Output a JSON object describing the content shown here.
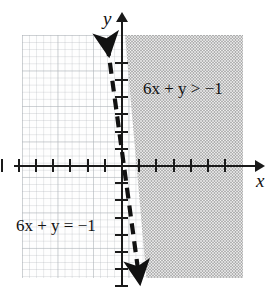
{
  "figure": {
    "kind": "cartesian-graph-linear-inequality",
    "axis_labels": {
      "x": "x",
      "y": "y"
    },
    "labels": {
      "inequality": "6x + y > −1",
      "equation": "6x + y = −1"
    },
    "colors": {
      "axis": "#1a1a1a",
      "line": "#111111",
      "shade": "#a9a9a9",
      "grid": "#bec3c8",
      "background": "#ffffff"
    }
  },
  "chart_data": {
    "type": "line",
    "title": "",
    "xlabel": "x",
    "ylabel": "y",
    "xlim": [
      -7,
      7
    ],
    "ylim": [
      -7,
      7
    ],
    "grid": true,
    "legend": "none",
    "x_ticks": [
      -7,
      -6,
      -5,
      -4,
      -3,
      -2,
      -1,
      1,
      2,
      3,
      4,
      5,
      6
    ],
    "y_ticks": [
      -7,
      -6,
      -5,
      -4,
      -3,
      -2,
      -1,
      1,
      2,
      3,
      4,
      5,
      6
    ],
    "series": [
      {
        "name": "6x + y = −1",
        "equation": "6x + y = -1",
        "slope": -6,
        "y_intercept": -1,
        "x_intercept": -0.1667,
        "style": "dashed",
        "arrows": "both",
        "points": [
          {
            "x": -0.8333,
            "y": 4
          },
          {
            "x": -0.1667,
            "y": 0
          },
          {
            "x": 0.8333,
            "y": -6
          }
        ]
      }
    ],
    "shaded_region": {
      "inequality": "6x + y > -1",
      "side": "right-of-line",
      "boundary_included": false,
      "fill": "gray-halftone",
      "test_point": {
        "x": 1,
        "y": 0,
        "satisfies": true
      }
    },
    "annotations": [
      {
        "text": "6x + y > −1",
        "x": 2.2,
        "y": 4.5
      },
      {
        "text": "6x + y = −1",
        "x": -5.6,
        "y": -3.3
      }
    ]
  }
}
